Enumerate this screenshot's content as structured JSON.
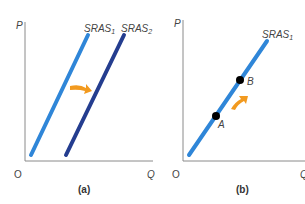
{
  "panel_a": {
    "y_axis_label": "P",
    "x_axis_label": "Q",
    "origin_label": "O",
    "curve1_label": "SRAS",
    "curve1_sub": "1",
    "curve2_label": "SRAS",
    "curve2_sub": "2",
    "caption": "(a)"
  },
  "panel_b": {
    "y_axis_label": "P",
    "x_axis_label": "Q",
    "origin_label": "O",
    "curve_label": "SRAS",
    "curve_sub": "1",
    "point_a": "A",
    "point_b": "B",
    "caption": "(b)"
  },
  "colors": {
    "sras1": "#2f86d8",
    "sras2": "#243d8f",
    "arrow": "#f29a1f",
    "axis": "#8a8a8a",
    "point": "#000000"
  }
}
